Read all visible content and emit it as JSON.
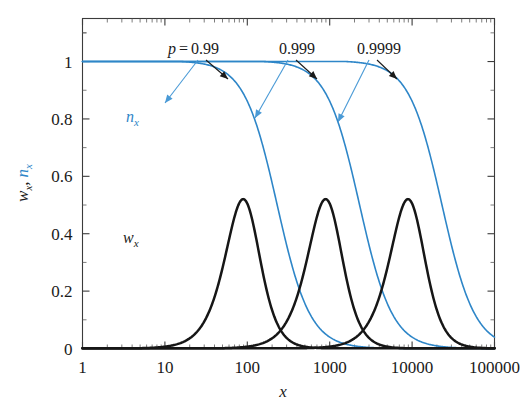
{
  "chart_data": {
    "type": "line",
    "title": "",
    "xlabel": "x",
    "ylabel": "w_x, n_x",
    "xscale": "log",
    "yscale": "linear",
    "xlim": [
      1,
      100000
    ],
    "ylim": [
      0,
      1.15
    ],
    "xticks": [
      "1",
      "10",
      "100",
      "1000",
      "10000",
      "100000"
    ],
    "xtick_values": [
      1,
      10,
      100,
      1000,
      10000,
      100000
    ],
    "yticks": [
      "0",
      "0.2",
      "0.4",
      "0.6",
      "0.8",
      "1"
    ],
    "ytick_values": [
      0,
      0.2,
      0.4,
      0.6,
      0.8,
      1
    ],
    "grid": false,
    "legend_position": "inline-annotations",
    "series": [
      {
        "name": "w_x (p = 0.99)",
        "kind": "weight-distribution",
        "color": "#161616",
        "peak_x": 100,
        "peak_y": 0.99,
        "x": [
          1,
          2,
          5,
          10,
          20,
          40,
          70,
          100,
          140,
          200,
          300,
          500,
          700,
          1000,
          1500,
          2000,
          3000
        ],
        "y": [
          0.03,
          0.05,
          0.11,
          0.2,
          0.37,
          0.65,
          0.9,
          0.99,
          0.96,
          0.8,
          0.52,
          0.2,
          0.08,
          0.02,
          0.005,
          0.001,
          0.0
        ]
      },
      {
        "name": "w_x (p = 0.999)",
        "kind": "weight-distribution",
        "color": "#161616",
        "peak_x": 1000,
        "peak_y": 0.99,
        "x": [
          1,
          10,
          20,
          50,
          100,
          200,
          400,
          700,
          1000,
          1400,
          2000,
          3000,
          5000,
          7000,
          10000,
          20000
        ],
        "y": [
          0.0,
          0.01,
          0.02,
          0.05,
          0.11,
          0.22,
          0.45,
          0.83,
          0.99,
          0.95,
          0.79,
          0.5,
          0.18,
          0.07,
          0.02,
          0.0
        ]
      },
      {
        "name": "w_x (p = 0.9999)",
        "kind": "weight-distribution",
        "color": "#161616",
        "peak_x": 10000,
        "peak_y": 0.99,
        "x": [
          1,
          100,
          200,
          500,
          1000,
          2000,
          4000,
          7000,
          10000,
          14000,
          20000,
          30000,
          50000,
          70000,
          100000
        ],
        "y": [
          0.0,
          0.0,
          0.01,
          0.03,
          0.08,
          0.2,
          0.45,
          0.82,
          0.99,
          0.95,
          0.79,
          0.5,
          0.17,
          0.06,
          0.0
        ]
      },
      {
        "name": "n_x (p = 0.99)",
        "kind": "number-distribution",
        "color": "#2e86c8",
        "x": [
          1,
          2,
          5,
          10,
          20,
          40,
          70,
          100,
          150,
          250,
          400,
          700,
          1000,
          2000
        ],
        "y": [
          1.0,
          0.99,
          0.96,
          0.91,
          0.82,
          0.67,
          0.5,
          0.37,
          0.22,
          0.09,
          0.03,
          0.005,
          0.001,
          0.0
        ]
      },
      {
        "name": "n_x (p = 0.999)",
        "kind": "number-distribution",
        "color": "#2e86c8",
        "x": [
          1,
          10,
          50,
          100,
          200,
          400,
          700,
          1000,
          1500,
          2500,
          4000,
          7000,
          10000,
          20000
        ],
        "y": [
          1.0,
          0.995,
          0.97,
          0.94,
          0.87,
          0.73,
          0.55,
          0.4,
          0.24,
          0.09,
          0.03,
          0.005,
          0.001,
          0.0
        ]
      },
      {
        "name": "n_x (p = 0.9999)",
        "kind": "number-distribution",
        "color": "#2e86c8",
        "x": [
          1,
          100,
          500,
          1000,
          2000,
          4000,
          7000,
          10000,
          15000,
          25000,
          40000,
          70000,
          100000
        ],
        "y": [
          1.0,
          0.995,
          0.975,
          0.95,
          0.88,
          0.74,
          0.56,
          0.41,
          0.25,
          0.1,
          0.03,
          0.005,
          0.0
        ]
      }
    ],
    "annotations": [
      {
        "id": "p099",
        "text_prefix": "p",
        "text_eq": "=",
        "text_value": "0.99",
        "label_x": 100,
        "points_to_black_peak": 100,
        "points_to_blue_at": 300
      },
      {
        "id": "p0999",
        "text_prefix": "",
        "text_eq": "",
        "text_value": "0.999",
        "label_x": 1000,
        "points_to_black_peak": 1000,
        "points_to_blue_at": 3000
      },
      {
        "id": "p09999",
        "text_prefix": "",
        "text_eq": "",
        "text_value": "0.9999",
        "label_x": 10000,
        "points_to_black_peak": 10000,
        "points_to_blue_at": 30000
      }
    ],
    "curve_labels": [
      {
        "id": "nx",
        "base": "n",
        "sub": "x",
        "color": "#2e86c8"
      },
      {
        "id": "wx",
        "base": "w",
        "sub": "x",
        "color": "#161616"
      }
    ],
    "colors": {
      "black_curve": "#161616",
      "blue_curve": "#2e86c8",
      "blue_arrow": "#4a9ad6",
      "axis": "#3b3b3b",
      "background": "#ffffff"
    }
  }
}
